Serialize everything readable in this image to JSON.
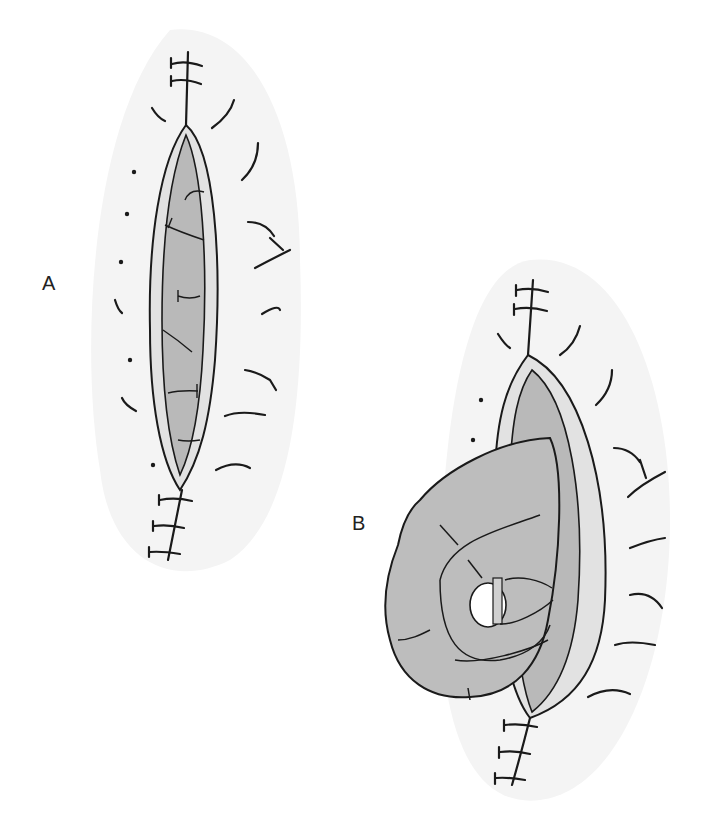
{
  "figure": {
    "panels": [
      {
        "id": "A",
        "label": "A",
        "description": "Open fascial incision with sutures above and below, exposed peritoneum"
      },
      {
        "id": "B",
        "label": "B",
        "description": "Open incision with bowel loop herniating through fascial defect"
      }
    ],
    "colors": {
      "background": "#ffffff",
      "skin": "#f4f4f4",
      "fascia_edge": "#e2e2e2",
      "tissue": "#b9b9b9",
      "bowel": "#bdbdbd",
      "line": "#1a1a1a"
    }
  }
}
